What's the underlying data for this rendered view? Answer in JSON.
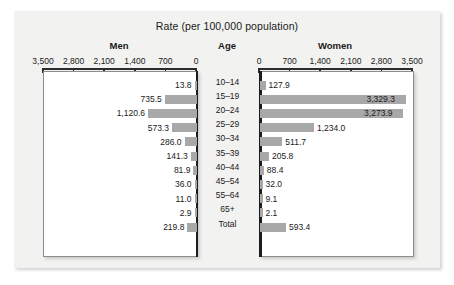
{
  "chart_data": {
    "type": "bar",
    "title": "Rate (per 100,000 population)",
    "subtype": "population-pyramid",
    "xlabel": "Rate (per 100,000 population)",
    "ylabel": "Age",
    "grid": false,
    "legend": "none",
    "axis_max": 3500,
    "tick_values": [
      0,
      700,
      1400,
      2100,
      2800,
      3500
    ],
    "left_ticks": [
      "3,500",
      "2,800",
      "2,100",
      "1,400",
      "700",
      "0"
    ],
    "right_ticks": [
      "0",
      "700",
      "1,400",
      "2,100",
      "2,800",
      "3,500"
    ],
    "categories": [
      "10–14",
      "15–19",
      "20–24",
      "25–29",
      "30–34",
      "35–39",
      "40–44",
      "45–54",
      "55–64",
      "65+",
      "Total"
    ],
    "series": [
      {
        "name": "Men",
        "side": "left",
        "values": [
          13.8,
          735.5,
          1120.6,
          573.3,
          286.0,
          141.3,
          81.9,
          36.0,
          11.0,
          2.9,
          219.8
        ],
        "labels": [
          "13.8",
          "735.5",
          "1,120.6",
          "573.3",
          "286.0",
          "141.3",
          "81.9",
          "36.0",
          "11.0",
          "2.9",
          "219.8"
        ]
      },
      {
        "name": "Women",
        "side": "right",
        "values": [
          127.9,
          3329.3,
          3273.9,
          1234.0,
          511.7,
          205.8,
          88.4,
          32.0,
          9.1,
          2.1,
          593.4
        ],
        "labels": [
          "127.9",
          "3,329.3",
          "3,273.9",
          "1,234.0",
          "511.7",
          "205.8",
          "88.4",
          "32.0",
          "9.1",
          "2.1",
          "593.4"
        ]
      }
    ]
  },
  "headers": {
    "men": "Men",
    "age": "Age",
    "women": "Women"
  },
  "colors": {
    "bar": "#a8a8a8",
    "panel": "#f2f2f0",
    "plot": "#ffffff",
    "axis": "#1c1c1c",
    "text": "#1a1a1a"
  }
}
